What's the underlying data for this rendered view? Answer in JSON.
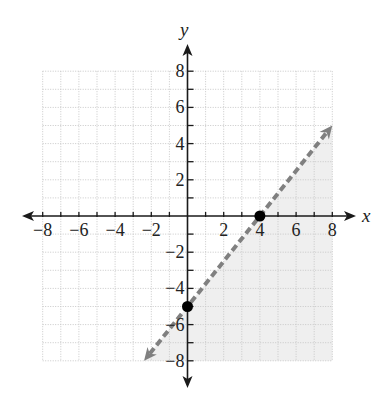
{
  "chart_data": {
    "type": "line",
    "title": "",
    "xlabel": "x",
    "ylabel": "y",
    "xlim": [
      -8,
      8
    ],
    "ylim": [
      -8,
      8
    ],
    "grid": true,
    "x_ticks": [
      -8,
      -6,
      -4,
      -2,
      2,
      4,
      6,
      8
    ],
    "y_ticks": [
      8,
      6,
      4,
      2,
      -2,
      -4,
      -6,
      -8
    ],
    "x_tick_labels": [
      "−8",
      "−6",
      "−4",
      "−2",
      "2",
      "4",
      "6",
      "8"
    ],
    "y_tick_labels": [
      "8",
      "6",
      "4",
      "2",
      "−2",
      "−4",
      "−6",
      "−8"
    ],
    "boundary_line": {
      "style": "dashed",
      "slope": 1.25,
      "intercept": -5,
      "equation": "y = (5/4)x − 5",
      "from": [
        -2.4,
        -8
      ],
      "to": [
        8,
        5
      ],
      "color": "#808080",
      "arrows": "both"
    },
    "points": [
      {
        "x": 0,
        "y": -5,
        "label": "y-intercept"
      },
      {
        "x": 4,
        "y": 0,
        "label": "x-intercept"
      }
    ],
    "shaded_region": {
      "side": "below-right of line",
      "inequality": "y < (5/4)x − 5",
      "color": "#efefef"
    }
  },
  "labels": {
    "x_axis": "x",
    "y_axis": "y"
  },
  "colors": {
    "axis": "#1a1a1a",
    "grid": "#c8c8c8",
    "shade": "#efefef",
    "line": "#808080",
    "point": "#000000"
  }
}
